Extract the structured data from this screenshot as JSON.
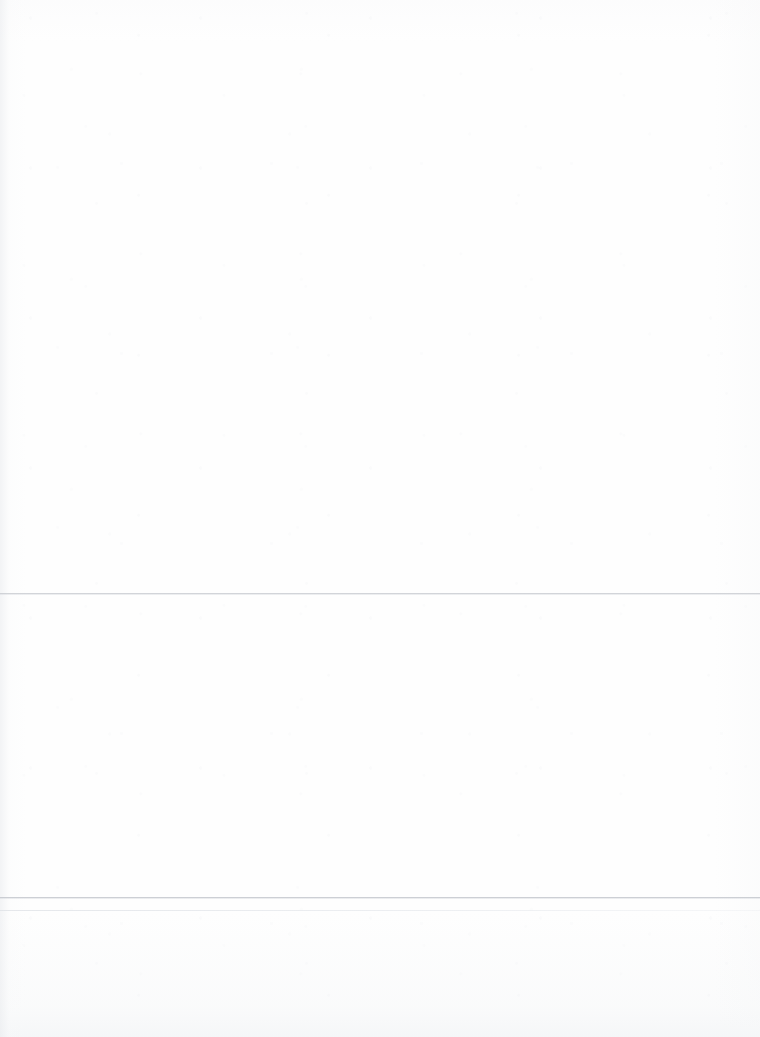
{
  "document": {
    "kind": "scanned-page",
    "page_width": 760,
    "page_height": 1037,
    "background_color": "#fefefe",
    "legibility_note": "Text is nearly illegible — extremely low contrast washed-out scan; glyph shapes are not resolvable.",
    "ink_color": "#c4c8d0",
    "rule_color": "#bcbfc5"
  },
  "title_block": {
    "line_1": "",
    "line_2": ""
  },
  "section_one": {
    "heading": "",
    "subtitle_prefix": "",
    "subtitle_rest": ""
  },
  "section_two": {
    "heading": ""
  },
  "rules": {
    "upper_label": "section-divider-upper",
    "lower_primary_label": "section-divider-lower",
    "lower_secondary_label": "footer-divider"
  }
}
